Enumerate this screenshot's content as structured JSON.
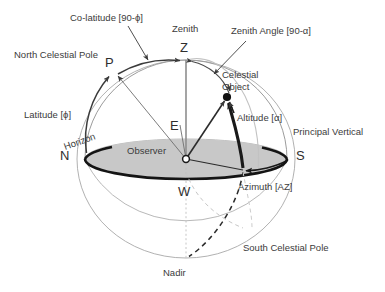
{
  "figure": {
    "type": "celestial-sphere-horizon-coordinate-diagram",
    "background_color": "#ffffff",
    "ink_color": "#3b3b3b",
    "horizon_fill": "#c8c8c8",
    "sphere_outline_color": "#9a9a9a",
    "emphasis_color": "#1a1a1a"
  },
  "labels": {
    "co_latitude": "Co-latitude [90-ϕ]",
    "zenith": "Zenith",
    "zenith_angle": "Zenith Angle [90-α]",
    "north_celestial_pole": "North Celestial Pole",
    "celestial_object_line1": "Celestial",
    "celestial_object_line2": "Object",
    "latitude": "Latitude [ϕ]",
    "altitude": "Altitude [α]",
    "horizon": "Horizon",
    "principal_vertical": "Principal Vertical",
    "observer": "Observer",
    "azimuth": "Azimuth [AZ]",
    "south_celestial_pole": "South Celestial Pole",
    "nadir": "Nadir"
  },
  "points": {
    "z": "Z",
    "p": "P",
    "e": "E",
    "n": "N",
    "s": "S",
    "w": "W"
  },
  "geometry": {
    "sphere_center_x": 186,
    "sphere_center_y": 159,
    "sphere_radius_x": 109,
    "sphere_radius_y": 99,
    "horizon_ellipse_rx": 101,
    "horizon_ellipse_ry": 20,
    "zenith_point": [
      186,
      60
    ],
    "nadir_point": [
      186,
      258
    ],
    "pole_point": [
      113,
      72
    ],
    "object_point": [
      227,
      97
    ],
    "east_point": [
      185,
      131
    ],
    "north_point": [
      85,
      159
    ],
    "south_point": [
      288,
      159
    ],
    "azimuth_foot": [
      245,
      170
    ]
  }
}
